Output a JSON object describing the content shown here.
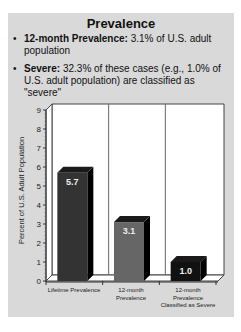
{
  "slide": {
    "title": "Prevalence",
    "bullets": [
      {
        "bold": "12-month Prevalence:",
        "text": " 3.1% of U.S. adult population"
      },
      {
        "bold": "Severe:",
        "text": " 32.3% of these cases (e.g., 1.0% of U.S. adult population) are classified as \"severe\""
      }
    ],
    "bullet_glyph": "•"
  },
  "chart_data": {
    "type": "bar",
    "style": "3d-column",
    "title": "",
    "xlabel": "",
    "ylabel": "Percent of U.S. Adult Population",
    "ylim": [
      0,
      9
    ],
    "yticks": [
      0,
      1,
      2,
      3,
      4,
      5,
      6,
      7,
      8,
      9
    ],
    "categories": [
      "Lifetime Prevalence",
      "12-month Prevalence",
      "12-month Prevalence Classified as Severe"
    ],
    "values": [
      5.7,
      3.1,
      1.0
    ],
    "data_labels": [
      "5.7",
      "3.1",
      "1.0"
    ],
    "bar_colors": [
      "#333333",
      "#666666",
      "#111111"
    ],
    "grid": false,
    "legend": null
  },
  "labels": {
    "ylabel": "Percent of U.S. Adult Population",
    "cat0": "Lifetime Prevalence",
    "cat1": "12-month Prevalence",
    "cat2": "12-month Prevalence Classified as Severe"
  }
}
